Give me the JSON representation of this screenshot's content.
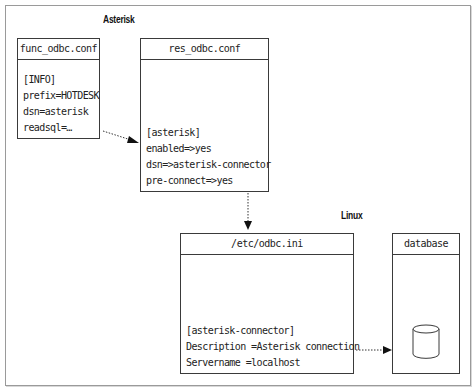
{
  "sections": {
    "asterisk": "Asterisk",
    "linux": "Linux"
  },
  "boxes": {
    "func_odbc": {
      "title": "func_odbc.conf",
      "lines": [
        "[INFO]",
        "prefix=HOTDESK",
        "dsn=asterisk",
        "readsql=…"
      ]
    },
    "res_odbc": {
      "title": "res_odbc.conf",
      "lines": [
        "[asterisk]",
        "enabled=>yes",
        "dsn=>asterisk-connector",
        "pre-connect=>yes"
      ]
    },
    "odbc_ini": {
      "title": "/etc/odbc.ini",
      "lines": [
        "[asterisk-connector]",
        "Description =Asterisk connection",
        "Servername =localhost"
      ]
    },
    "database": {
      "title": "database",
      "icon": "database-cylinder-icon"
    }
  },
  "connections": [
    {
      "from": "func_odbc",
      "to": "res_odbc",
      "style": "dotted-arrow"
    },
    {
      "from": "res_odbc",
      "to": "odbc_ini",
      "style": "dotted-arrow"
    },
    {
      "from": "odbc_ini",
      "to": "database",
      "style": "dotted-arrow"
    }
  ],
  "colors": {
    "stroke": "#3a3a3a",
    "frame": "#9a9a9a",
    "text": "#222222"
  }
}
